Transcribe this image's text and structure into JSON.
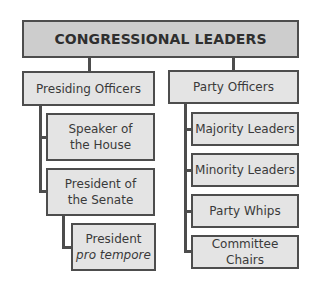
{
  "diagram": {
    "root": {
      "label": "CONGRESSIONAL LEADERS"
    },
    "branches": [
      {
        "label": "Presiding Officers",
        "children": [
          {
            "line1": "Speaker of",
            "line2": "the House"
          },
          {
            "line1": "President of",
            "line2": "the Senate",
            "children": [
              {
                "line1": "President",
                "line2": "pro tempore",
                "line2_style": "italic"
              }
            ]
          }
        ]
      },
      {
        "label": "Party Officers",
        "children": [
          {
            "label": "Majority Leaders"
          },
          {
            "label": "Minority Leaders"
          },
          {
            "label": "Party Whips"
          },
          {
            "label": "Committee Chairs"
          }
        ]
      }
    ],
    "colors": {
      "border": "#4d4d4d",
      "root_fill": "#cdcdcd",
      "node_fill": "#e4e4e4",
      "text": "#3a3a3a"
    }
  }
}
